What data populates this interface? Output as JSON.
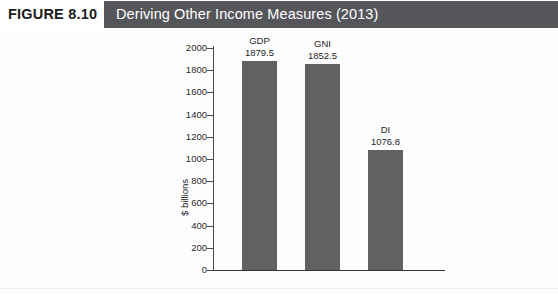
{
  "figure": {
    "number_label": "FIGURE 8.10",
    "title": "Deriving Other Income Measures (2013)",
    "band_color": "#55565a",
    "number_color": "#1b1b1b",
    "title_color": "#ffffff"
  },
  "chart_data": {
    "type": "bar",
    "title": "Deriving Other Income Measures (2013)",
    "xlabel": "",
    "ylabel": "$ billions",
    "categories": [
      "GDP",
      "GNI",
      "DI"
    ],
    "values": [
      1879.5,
      1852.5,
      1076.8
    ],
    "value_labels": [
      "1879.5",
      "1852.5",
      "1076.8"
    ],
    "ylim": [
      0,
      2000
    ],
    "ytick_step": 200,
    "yticks": [
      2000,
      1800,
      1600,
      1400,
      1200,
      1000,
      800,
      600,
      400,
      200,
      0
    ],
    "ytick_labels": [
      "2000",
      "1800",
      "1600",
      "1400",
      "1200",
      "1000",
      "800",
      "600",
      "400",
      "200",
      "0"
    ],
    "grid": false,
    "legend": false,
    "legend_position": "none",
    "bar_color": "#616161",
    "axis_color": "#33363a",
    "series": [
      {
        "name": "Income measure",
        "values": [
          1879.5,
          1852.5,
          1076.8
        ]
      }
    ]
  }
}
